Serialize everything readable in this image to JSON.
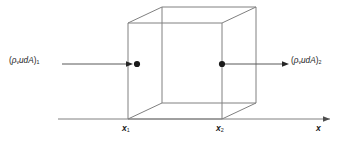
{
  "figure": {
    "type": "control-volume-diagram",
    "line_color": "#808080",
    "marker_color": "#1a1a1a",
    "text_color": "#1a1a1a",
    "background": "#ffffff"
  },
  "labels": {
    "flux_in": {
      "open_paren": "(",
      "rho": "ρ",
      "rho_sub": "v",
      "body": "udA",
      "close_paren": ")",
      "index": "1",
      "full": "(ρᵥudA)₁"
    },
    "flux_out": {
      "open_paren": "(",
      "rho": "ρ",
      "rho_sub": "v",
      "body": "udA",
      "close_paren": ")",
      "index": "2",
      "full": "(ρᵥudA)₂"
    },
    "x1": {
      "symbol": "x",
      "sub": "1"
    },
    "x2": {
      "symbol": "x",
      "sub": "2"
    },
    "axis": {
      "symbol": "x"
    }
  },
  "geometry": {
    "axis": {
      "x_start": 58,
      "x_end": 332,
      "y": 119,
      "arrow": "right"
    },
    "cube": {
      "front_face": {
        "left": 128,
        "right": 222,
        "top": 23,
        "bottom": 119
      },
      "depth_dx": 34,
      "depth_dy": -16
    },
    "arrow_in": {
      "x_start": 62,
      "x_end": 131,
      "y": 64
    },
    "arrow_out": {
      "x_start": 222,
      "x_end": 288,
      "y": 64
    },
    "dot_in": {
      "x": 135,
      "y": 64,
      "r": 3
    },
    "dot_out": {
      "x": 222,
      "y": 64,
      "r": 3
    }
  }
}
